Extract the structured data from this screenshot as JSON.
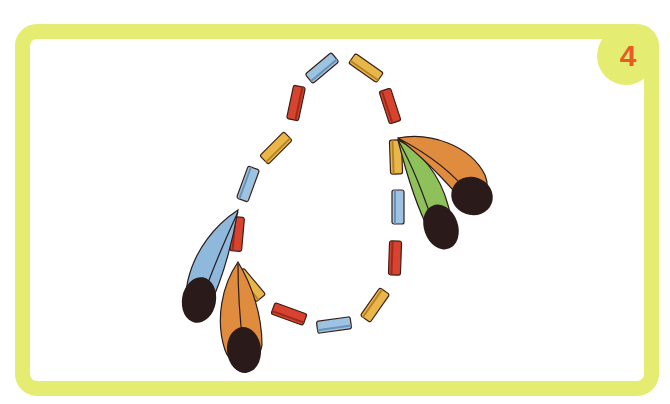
{
  "step_badge": {
    "number": "4"
  },
  "colors": {
    "frame": "#e4ec72",
    "badge_number": "#ea5a26",
    "bead_red": "#d8432f",
    "bead_yellow": "#e9b64a",
    "bead_blue": "#9cc3e2",
    "feather_blue": "#8fb8dd",
    "feather_orange": "#e08c3e",
    "feather_green": "#8ec15a",
    "feather_tip": "#2a1a1a"
  },
  "illustration": {
    "subject": "bead necklace with feathers",
    "beads_count": 20,
    "feather_groups": [
      {
        "position": "left",
        "feathers": [
          "blue",
          "orange"
        ]
      },
      {
        "position": "right",
        "feathers": [
          "orange",
          "green"
        ]
      }
    ]
  }
}
